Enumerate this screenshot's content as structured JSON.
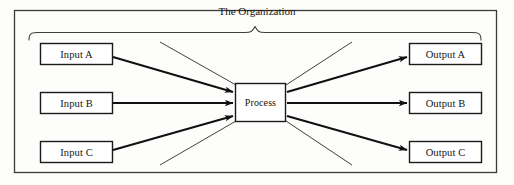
{
  "diagram": {
    "type": "systems-input-process-output",
    "title": "The Organization",
    "outer_frame": {
      "stroke": "#3a3a3a"
    },
    "brace": {
      "label": "organization-brace",
      "stroke": "#3f3f3f"
    },
    "inputs": [
      {
        "id": "input-a",
        "label": "Input A"
      },
      {
        "id": "input-b",
        "label": "Input B"
      },
      {
        "id": "input-c",
        "label": "Input C"
      }
    ],
    "process": {
      "id": "process",
      "label": "Process"
    },
    "outputs": [
      {
        "id": "output-a",
        "label": "Output A"
      },
      {
        "id": "output-b",
        "label": "Output B"
      },
      {
        "id": "output-c",
        "label": "Output C"
      }
    ],
    "arrows": [
      {
        "from": "Input A",
        "to": "Process",
        "style": "thick"
      },
      {
        "from": "Input B",
        "to": "Process",
        "style": "thick"
      },
      {
        "from": "Input C",
        "to": "Process",
        "style": "thick"
      },
      {
        "from": "Process",
        "to": "Output A",
        "style": "thick"
      },
      {
        "from": "Process",
        "to": "Output B",
        "style": "thick"
      },
      {
        "from": "Process",
        "to": "Output C",
        "style": "thick"
      }
    ],
    "boundary_lines": [
      {
        "id": "boundary-upper-left",
        "style": "thin"
      },
      {
        "id": "boundary-lower-left",
        "style": "thin"
      },
      {
        "id": "boundary-upper-right",
        "style": "thin"
      },
      {
        "id": "boundary-lower-right",
        "style": "thin"
      }
    ],
    "colors": {
      "box_stroke": "#1a1a1a",
      "arrow": "#111111",
      "thin_line": "#2b2b2b",
      "frame": "#3a3a3a",
      "text": "#141414",
      "background": "#fdfdfc"
    }
  }
}
